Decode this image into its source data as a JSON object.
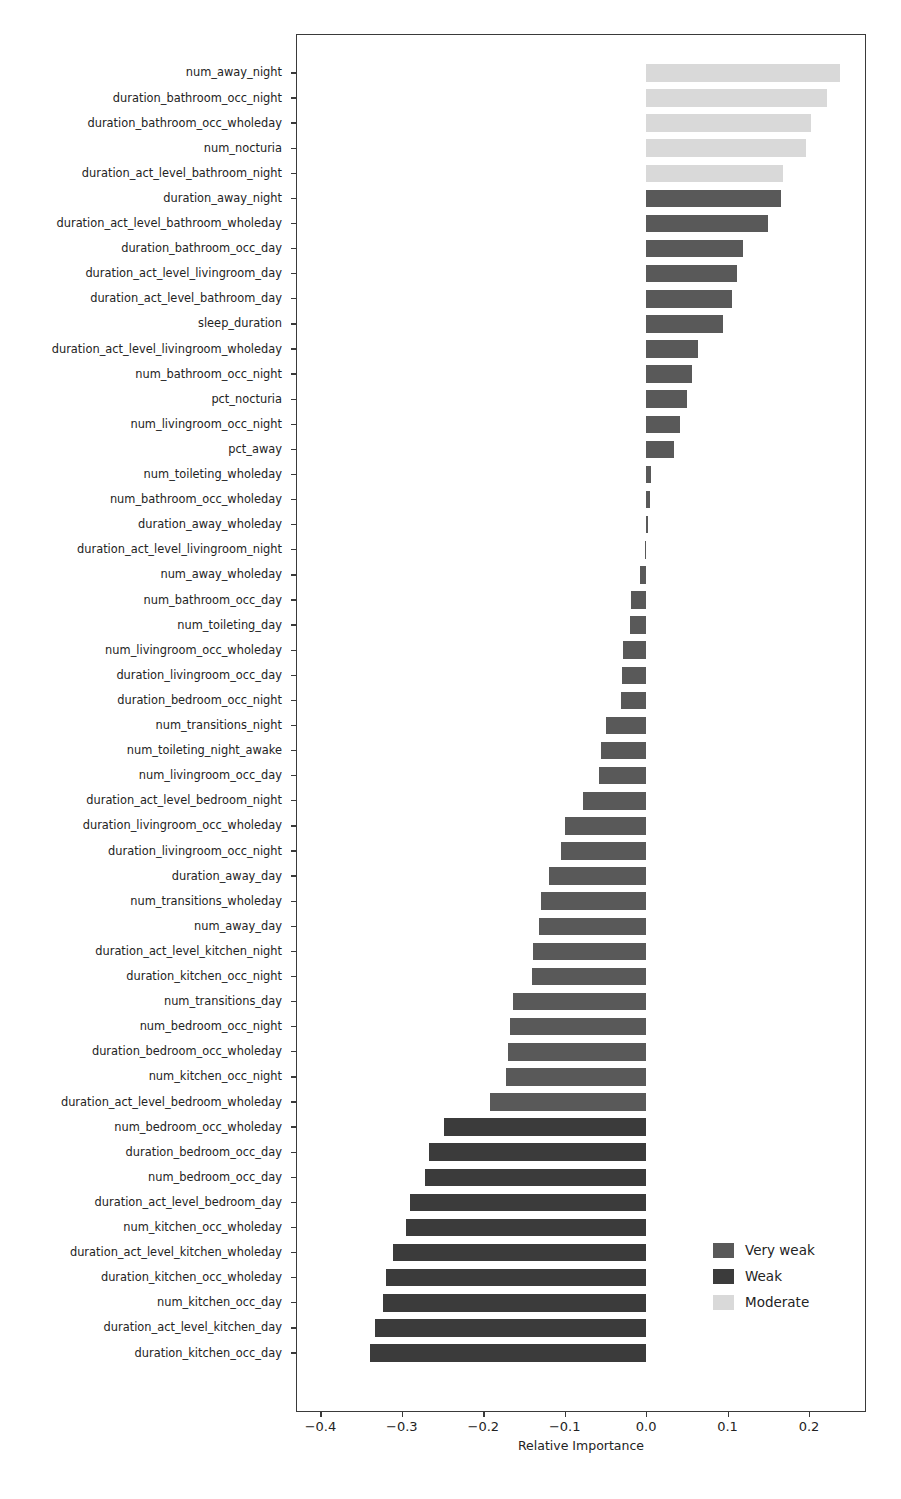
{
  "chart_data": {
    "type": "bar",
    "orientation": "horizontal",
    "title": "",
    "xlabel": "Relative Importance",
    "ylabel": "",
    "xlim": [
      -0.43,
      0.27
    ],
    "xticks": [
      -0.4,
      -0.3,
      -0.2,
      -0.1,
      0.0,
      0.1,
      0.2
    ],
    "xticklabels": [
      "−0.4",
      "−0.3",
      "−0.2",
      "−0.1",
      "0.0",
      "0.1",
      "0.2"
    ],
    "grid": false,
    "legend_position": "lower right",
    "legend": [
      {
        "label": "Very weak",
        "color": "#595959"
      },
      {
        "label": "Weak",
        "color": "#3b3b3b"
      },
      {
        "label": "Moderate",
        "color": "#d9d9d9"
      }
    ],
    "categories": [
      "num_away_night",
      "duration_bathroom_occ_night",
      "duration_bathroom_occ_wholeday",
      "num_nocturia",
      "duration_act_level_bathroom_night",
      "duration_away_night",
      "duration_act_level_bathroom_wholeday",
      "duration_bathroom_occ_day",
      "duration_act_level_livingroom_day",
      "duration_act_level_bathroom_day",
      "sleep_duration",
      "duration_act_level_livingroom_wholeday",
      "num_bathroom_occ_night",
      "pct_nocturia",
      "num_livingroom_occ_night",
      "pct_away",
      "num_toileting_wholeday",
      "num_bathroom_occ_wholeday",
      "duration_away_wholeday",
      "duration_act_level_livingroom_night",
      "num_away_wholeday",
      "num_bathroom_occ_day",
      "num_toileting_day",
      "num_livingroom_occ_wholeday",
      "duration_livingroom_occ_day",
      "duration_bedroom_occ_night",
      "num_transitions_night",
      "num_toileting_night_awake",
      "num_livingroom_occ_day",
      "duration_act_level_bedroom_night",
      "duration_livingroom_occ_wholeday",
      "duration_livingroom_occ_night",
      "duration_away_day",
      "num_transitions_wholeday",
      "num_away_day",
      "duration_act_level_kitchen_night",
      "duration_kitchen_occ_night",
      "num_transitions_day",
      "num_bedroom_occ_night",
      "duration_bedroom_occ_wholeday",
      "num_kitchen_occ_night",
      "duration_act_level_bedroom_wholeday",
      "num_bedroom_occ_wholeday",
      "duration_bedroom_occ_day",
      "num_bedroom_occ_day",
      "duration_act_level_bedroom_day",
      "num_kitchen_occ_wholeday",
      "duration_act_level_kitchen_wholeday",
      "duration_kitchen_occ_wholeday",
      "num_kitchen_occ_day",
      "duration_act_level_kitchen_day",
      "duration_kitchen_occ_day"
    ],
    "values": [
      0.238,
      0.222,
      0.203,
      0.196,
      0.168,
      0.166,
      0.15,
      0.119,
      0.111,
      0.105,
      0.094,
      0.064,
      0.056,
      0.05,
      0.042,
      0.034,
      0.006,
      0.005,
      0.002,
      -0.002,
      -0.008,
      -0.019,
      -0.02,
      -0.029,
      -0.03,
      -0.031,
      -0.049,
      -0.055,
      -0.058,
      -0.077,
      -0.1,
      -0.105,
      -0.119,
      -0.129,
      -0.132,
      -0.139,
      -0.14,
      -0.163,
      -0.167,
      -0.17,
      -0.172,
      -0.192,
      -0.248,
      -0.267,
      -0.272,
      -0.29,
      -0.295,
      -0.311,
      -0.32,
      -0.323,
      -0.333,
      -0.339
    ],
    "bar_classes": [
      "Moderate",
      "Moderate",
      "Moderate",
      "Moderate",
      "Moderate",
      "Very weak",
      "Very weak",
      "Very weak",
      "Very weak",
      "Very weak",
      "Very weak",
      "Very weak",
      "Very weak",
      "Very weak",
      "Very weak",
      "Very weak",
      "Very weak",
      "Very weak",
      "Very weak",
      "Very weak",
      "Very weak",
      "Very weak",
      "Very weak",
      "Very weak",
      "Very weak",
      "Very weak",
      "Very weak",
      "Very weak",
      "Very weak",
      "Very weak",
      "Very weak",
      "Very weak",
      "Very weak",
      "Very weak",
      "Very weak",
      "Very weak",
      "Very weak",
      "Very weak",
      "Very weak",
      "Very weak",
      "Very weak",
      "Very weak",
      "Weak",
      "Weak",
      "Weak",
      "Weak",
      "Weak",
      "Weak",
      "Weak",
      "Weak",
      "Weak",
      "Weak"
    ]
  }
}
